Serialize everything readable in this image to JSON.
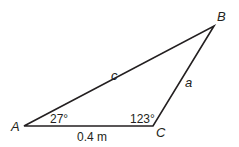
{
  "figure": {
    "type": "triangle",
    "vertices": {
      "A": {
        "label": "A",
        "x": 24,
        "y": 126
      },
      "B": {
        "label": "B",
        "x": 214,
        "y": 26
      },
      "C": {
        "label": "C",
        "x": 153,
        "y": 126
      }
    },
    "sides": {
      "c": {
        "label": "c"
      },
      "a": {
        "label": "a"
      },
      "b": {
        "label": "0.4 m"
      }
    },
    "angles": {
      "A": {
        "label": "27°"
      },
      "C": {
        "label": "123°"
      }
    },
    "stroke_color": "#231f20"
  }
}
